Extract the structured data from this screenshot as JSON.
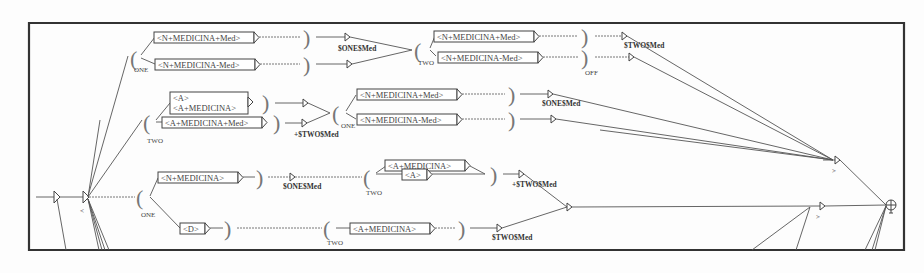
{
  "diagram": {
    "type": "finite-state-transducer-graph",
    "nodes": {
      "top1": "<N+MEDICINA+Med>",
      "top2": "<N+MEDICINA-Med>",
      "top3": "<N+MEDICINA+Med>",
      "top4": "<N+MEDICINA-Med>",
      "mid1a": "<A>",
      "mid1b": "<A+MEDICINA>",
      "mid2": "<A+MEDICINA+Med>",
      "mid3": "<N+MEDICINA+Med>",
      "mid4": "<N+MEDICINA-Med>",
      "low1": "<N+MEDICINA>",
      "low2": "<A+MEDICINA>",
      "low3": "<A>",
      "low4": "<D>",
      "low5": "<A+MEDICINA>"
    },
    "outputs": {
      "one_med": "$ONE$Med",
      "two_med": "$TWO$Med",
      "plus_two_med": "+$TWO$Med",
      "one_med_2": "$ONE$Med",
      "one_med_3": "$ONE$Med",
      "plus_two_med_2": "+$TWO$Med",
      "two_med_2": "$TWO$Med"
    },
    "variables": {
      "one": "ONE",
      "two": "TWO",
      "off": "OFF",
      "one2": "ONE",
      "two2": "TWO",
      "one3": "ONE",
      "two3": "TWO",
      "two4": "TWO"
    },
    "context_marks": {
      "left": "<",
      "right1": ">",
      "right2": ">"
    }
  }
}
